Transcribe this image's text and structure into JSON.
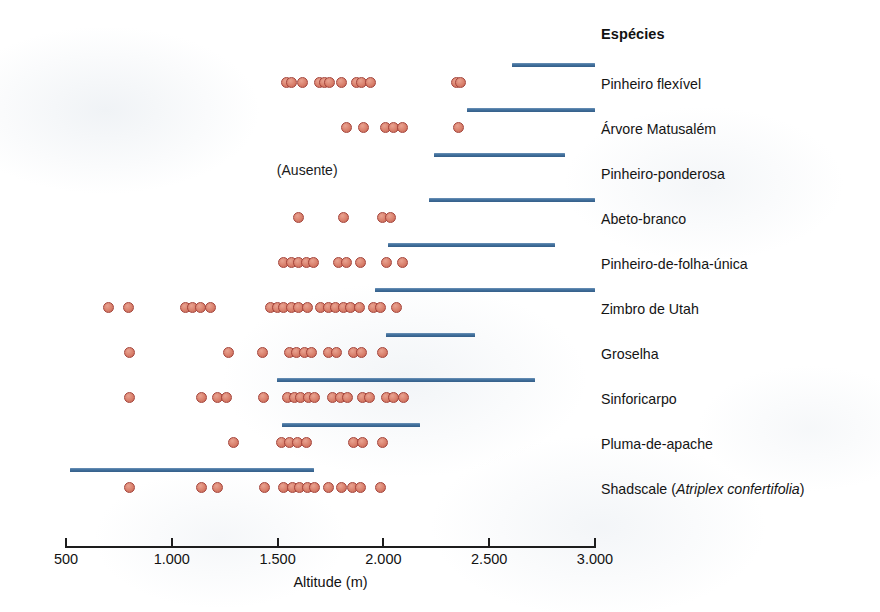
{
  "header": {
    "species_column_title": "Espécies"
  },
  "axis": {
    "title": "Altitude (m)",
    "min": 500,
    "max": 3000,
    "ticks": [
      {
        "value": 500,
        "label": "500"
      },
      {
        "value": 1000,
        "label": "1.000"
      },
      {
        "value": 1500,
        "label": "1.500"
      },
      {
        "value": 2000,
        "label": "2.000"
      },
      {
        "value": 2500,
        "label": "2.500"
      },
      {
        "value": 3000,
        "label": "3.000"
      }
    ]
  },
  "legend": {
    "bar_meaning": "Faixa altitudinal moderna (barra azul)",
    "dot_meaning": "Registros de pacotes de ratos-de-madeira (pontos vermelhos)"
  },
  "colors": {
    "bar": "#3f6f9c",
    "dot_fill": "#d9806c",
    "dot_stroke": "#a4433a",
    "text": "#141414",
    "axis": "#1d1d1d",
    "background": "#ffffff"
  },
  "chart_data": {
    "type": "scatter",
    "title": "",
    "xlabel": "Altitude (m)",
    "ylabel": "Espécies",
    "xlim": [
      500,
      3000
    ],
    "grid": false,
    "legend_position": "none",
    "x_tick_labels": [
      "500",
      "1.000",
      "1.500",
      "2.000",
      "2.500",
      "3.000"
    ],
    "x_tick_values": [
      500,
      1000,
      1500,
      2000,
      2500,
      3000
    ],
    "series": [
      {
        "name": "Pinheiro flexível",
        "absent_note": null,
        "modern_range": [
          2610,
          3000
        ],
        "records": [
          1540,
          1565,
          1620,
          1700,
          1720,
          1745,
          1800,
          1875,
          1895,
          1940,
          2345,
          2365
        ]
      },
      {
        "name": "Árvore Matusalém",
        "absent_note": null,
        "modern_range": [
          2395,
          3000
        ],
        "records": [
          1825,
          1905,
          2010,
          2050,
          2090,
          2355
        ]
      },
      {
        "name": "Pinheiro-ponderosa",
        "absent_note": "(Ausente)",
        "modern_range": [
          2240,
          2860
        ],
        "records": []
      },
      {
        "name": "Abeto-branco",
        "absent_note": null,
        "modern_range": [
          2215,
          3000
        ],
        "records": [
          1600,
          1810,
          1995,
          2035
        ]
      },
      {
        "name": "Pinheiro-de-folha-única",
        "absent_note": null,
        "modern_range": [
          2020,
          2810
        ],
        "records": [
          1530,
          1565,
          1600,
          1635,
          1670,
          1790,
          1825,
          1890,
          2015,
          2090
        ]
      },
      {
        "name": "Zimbro de Utah",
        "absent_note": null,
        "modern_range": [
          1960,
          3000
        ],
        "records": [
          700,
          795,
          1065,
          1100,
          1135,
          1185,
          1465,
          1500,
          1530,
          1565,
          1600,
          1640,
          1705,
          1740,
          1775,
          1810,
          1845,
          1885,
          1955,
          1985,
          2060
        ]
      },
      {
        "name": "Groselha",
        "absent_note": null,
        "modern_range": [
          2010,
          2435
        ],
        "records": [
          800,
          1270,
          1430,
          1555,
          1590,
          1625,
          1660,
          1740,
          1780,
          1860,
          1895,
          1995
        ]
      },
      {
        "name": "Sinforicarpo",
        "absent_note": null,
        "modern_range": [
          1495,
          2715
        ],
        "records": [
          800,
          1140,
          1215,
          1260,
          1435,
          1545,
          1580,
          1610,
          1645,
          1675,
          1760,
          1795,
          1830,
          1900,
          1935,
          2015,
          2050,
          2095
        ]
      },
      {
        "name": "Pluma-de-apache",
        "absent_note": null,
        "modern_range": [
          1520,
          2175
        ],
        "records": [
          1290,
          1520,
          1555,
          1595,
          1635,
          1860,
          1900,
          1995
        ]
      },
      {
        "name": "Shadscale (Atriplex confertifolia)",
        "absent_note": null,
        "modern_range": [
          520,
          1670
        ],
        "records": [
          800,
          1140,
          1215,
          1440,
          1530,
          1570,
          1605,
          1640,
          1675,
          1740,
          1800,
          1855,
          1890,
          1985
        ]
      }
    ]
  }
}
